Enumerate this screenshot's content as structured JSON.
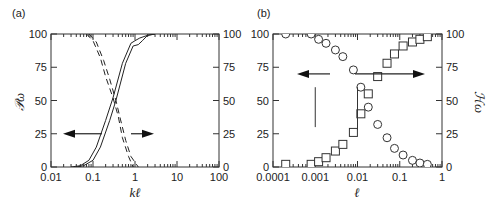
{
  "chart_data": [
    {
      "panel": "(a)",
      "type": "line",
      "xlabel": "kℓ",
      "ylabel_left": "P_ω",
      "ylabel_right": "",
      "xscale": "log",
      "xlim": [
        0.01,
        100
      ],
      "ylim": [
        0,
        100
      ],
      "x_ticks": [
        "0.01",
        "0.1",
        "1",
        "10",
        "100"
      ],
      "y_ticks": [
        "0",
        "25",
        "50",
        "75",
        "100"
      ],
      "grid": false,
      "annotations": [
        {
          "type": "arrow",
          "direction": "left",
          "y": 25,
          "meaning": "solid curves read on left axis"
        },
        {
          "type": "arrow",
          "direction": "right",
          "y": 25,
          "meaning": "dashed curves read on right axis"
        }
      ],
      "series": [
        {
          "name": "solid-1",
          "style": "solid",
          "x": [
            0.03,
            0.05,
            0.08,
            0.12,
            0.2,
            0.3,
            0.5,
            0.8,
            1.0,
            1.3,
            2.0,
            3.0
          ],
          "y": [
            0,
            1,
            5,
            15,
            35,
            52,
            78,
            93,
            95,
            97,
            99,
            100
          ]
        },
        {
          "name": "solid-2",
          "style": "solid",
          "x": [
            0.04,
            0.06,
            0.1,
            0.15,
            0.25,
            0.35,
            0.6,
            0.9,
            1.2,
            1.5,
            2.0,
            3.0
          ],
          "y": [
            0,
            1,
            5,
            15,
            35,
            50,
            78,
            91,
            92,
            95,
            99,
            100
          ]
        },
        {
          "name": "dashed-1",
          "style": "dashed",
          "x": [
            0.07,
            0.1,
            0.15,
            0.2,
            0.3,
            0.4,
            0.5,
            0.7,
            0.9
          ],
          "y": [
            100,
            95,
            82,
            68,
            52,
            38,
            22,
            8,
            0
          ]
        },
        {
          "name": "dashed-2",
          "style": "dashed",
          "x": [
            0.08,
            0.12,
            0.18,
            0.25,
            0.35,
            0.45,
            0.6,
            0.8,
            1.2
          ],
          "y": [
            100,
            94,
            80,
            66,
            50,
            36,
            20,
            8,
            0
          ]
        }
      ]
    },
    {
      "panel": "(b)",
      "type": "scatter",
      "xlabel": "ℓ",
      "ylabel_left": "",
      "ylabel_right": "H_ω",
      "xscale": "log",
      "xlim": [
        0.0001,
        1
      ],
      "ylim": [
        0,
        100
      ],
      "x_ticks": [
        "0.0001",
        "0.001",
        "0.01",
        "0.1",
        "1"
      ],
      "y_ticks": [
        "0",
        "25",
        "50",
        "75",
        "100"
      ],
      "grid": false,
      "annotations": [
        {
          "type": "arrow",
          "direction": "left",
          "y": 70,
          "meaning": "circles read on left axis"
        },
        {
          "type": "arrow",
          "direction": "right",
          "y": 70,
          "meaning": "squares read on right axis"
        },
        {
          "type": "vline",
          "x": 0.001,
          "y_range": [
            30,
            60
          ]
        },
        {
          "type": "vline",
          "x": 0.01,
          "y_range": [
            28,
            60
          ]
        }
      ],
      "series": [
        {
          "name": "circles",
          "marker": "circle",
          "axis": "left",
          "x": [
            0.0002,
            0.0008,
            0.0012,
            0.0018,
            0.003,
            0.0045,
            0.008,
            0.012,
            0.018,
            0.03,
            0.05,
            0.075,
            0.12,
            0.2,
            0.3,
            0.45
          ],
          "y": [
            100,
            100,
            96,
            93,
            88,
            83,
            73,
            60,
            45,
            32,
            22,
            14,
            9,
            5,
            3,
            2
          ]
        },
        {
          "name": "squares",
          "marker": "square",
          "axis": "right",
          "x": [
            0.0002,
            0.0008,
            0.0012,
            0.0018,
            0.003,
            0.0045,
            0.008,
            0.012,
            0.018,
            0.03,
            0.05,
            0.075,
            0.12,
            0.2,
            0.3,
            0.45
          ],
          "y": [
            2,
            2,
            4,
            7,
            12,
            17,
            26,
            40,
            55,
            68,
            78,
            85,
            91,
            94,
            96,
            98
          ]
        }
      ]
    }
  ],
  "labels": {
    "panel_a": "(a)",
    "panel_b": "(b)",
    "a_xlabel": "kℓ",
    "a_ylabel": "𝒫ω",
    "b_xlabel": "ℓ",
    "b_ylabel": "ℋω"
  }
}
